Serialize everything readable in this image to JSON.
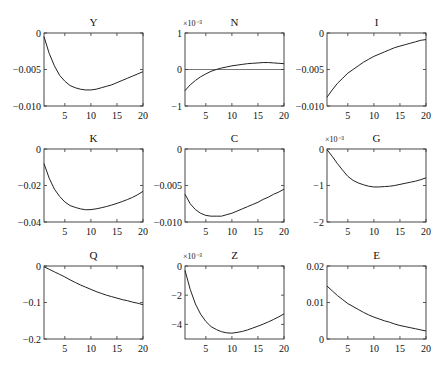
{
  "figure": {
    "layout": {
      "rows": 3,
      "cols": 3
    },
    "colors": {
      "line": "#222222",
      "axes": "#333333",
      "zero_line": "#555555"
    }
  },
  "chart_data": [
    {
      "type": "line",
      "title": "Y",
      "multiplier": "",
      "x": [
        1,
        2,
        3,
        4,
        5,
        6,
        7,
        8,
        9,
        10,
        11,
        12,
        13,
        14,
        15,
        16,
        17,
        18,
        19,
        20
      ],
      "values": [
        -0.0005,
        -0.0028,
        -0.0045,
        -0.0058,
        -0.0066,
        -0.0072,
        -0.0075,
        -0.0077,
        -0.0078,
        -0.0078,
        -0.0077,
        -0.0075,
        -0.0073,
        -0.0071,
        -0.0068,
        -0.0065,
        -0.0062,
        -0.0059,
        -0.0056,
        -0.0053
      ],
      "ylim": [
        -0.01,
        0
      ],
      "yticks": [
        0,
        -0.005,
        -0.01
      ],
      "ytick_labels": [
        "0",
        "-0.005",
        "-0.010"
      ],
      "xticks": [
        5,
        10,
        15,
        20
      ],
      "xlim": [
        1,
        20
      ],
      "zero_line": false
    },
    {
      "type": "line",
      "title": "N",
      "multiplier": "×10⁻³",
      "x": [
        1,
        2,
        3,
        4,
        5,
        6,
        7,
        8,
        9,
        10,
        11,
        12,
        13,
        14,
        15,
        16,
        17,
        18,
        19,
        20
      ],
      "values": [
        -0.58,
        -0.42,
        -0.3,
        -0.2,
        -0.12,
        -0.05,
        0.0,
        0.04,
        0.07,
        0.1,
        0.12,
        0.14,
        0.16,
        0.17,
        0.18,
        0.19,
        0.19,
        0.18,
        0.17,
        0.16
      ],
      "ylim": [
        -1,
        1
      ],
      "yticks": [
        1,
        0,
        -1
      ],
      "ytick_labels": [
        "1",
        "0",
        "-1"
      ],
      "xticks": [
        5,
        10,
        15,
        20
      ],
      "xlim": [
        1,
        20
      ],
      "zero_line": true
    },
    {
      "type": "line",
      "title": "I",
      "multiplier": "",
      "x": [
        1,
        2,
        3,
        4,
        5,
        6,
        7,
        8,
        9,
        10,
        11,
        12,
        13,
        14,
        15,
        16,
        17,
        18,
        19,
        20
      ],
      "values": [
        -0.0088,
        -0.0078,
        -0.0069,
        -0.0062,
        -0.0055,
        -0.005,
        -0.0045,
        -0.004,
        -0.0036,
        -0.0032,
        -0.0029,
        -0.0026,
        -0.0023,
        -0.002,
        -0.0018,
        -0.0016,
        -0.0014,
        -0.0012,
        -0.001,
        -0.0009
      ],
      "ylim": [
        -0.01,
        0
      ],
      "yticks": [
        0,
        -0.005,
        -0.01
      ],
      "ytick_labels": [
        "0",
        "-0.005",
        "-0.010"
      ],
      "xticks": [
        5,
        10,
        15,
        20
      ],
      "xlim": [
        1,
        20
      ],
      "zero_line": false
    },
    {
      "type": "line",
      "title": "K",
      "multiplier": "",
      "x": [
        1,
        2,
        3,
        4,
        5,
        6,
        7,
        8,
        9,
        10,
        11,
        12,
        13,
        14,
        15,
        16,
        17,
        18,
        19,
        20
      ],
      "values": [
        -0.008,
        -0.016,
        -0.022,
        -0.026,
        -0.029,
        -0.031,
        -0.032,
        -0.0328,
        -0.0333,
        -0.0332,
        -0.0328,
        -0.0322,
        -0.0315,
        -0.0307,
        -0.0298,
        -0.0288,
        -0.0277,
        -0.0265,
        -0.025,
        -0.0232
      ],
      "ylim": [
        -0.04,
        0
      ],
      "yticks": [
        0,
        -0.02,
        -0.04
      ],
      "ytick_labels": [
        "0",
        "-0.02",
        "-0.04"
      ],
      "xticks": [
        5,
        10,
        15,
        20
      ],
      "xlim": [
        1,
        20
      ],
      "zero_line": false
    },
    {
      "type": "line",
      "title": "C",
      "multiplier": "",
      "x": [
        1,
        2,
        3,
        4,
        5,
        6,
        7,
        8,
        9,
        10,
        11,
        12,
        13,
        14,
        15,
        16,
        17,
        18,
        19,
        20
      ],
      "values": [
        -0.0062,
        -0.0075,
        -0.0083,
        -0.0088,
        -0.0091,
        -0.0092,
        -0.0092,
        -0.0092,
        -0.009,
        -0.0088,
        -0.0085,
        -0.0082,
        -0.0079,
        -0.0076,
        -0.0073,
        -0.0069,
        -0.0066,
        -0.0062,
        -0.0059,
        -0.0055
      ],
      "ylim": [
        -0.01,
        0
      ],
      "yticks": [
        0,
        -0.005,
        -0.01
      ],
      "ytick_labels": [
        "0",
        "-0.005",
        "-0.010"
      ],
      "xticks": [
        5,
        10,
        15,
        20
      ],
      "xlim": [
        1,
        20
      ],
      "zero_line": false
    },
    {
      "type": "line",
      "title": "G",
      "multiplier": "×10⁻³",
      "x": [
        1,
        2,
        3,
        4,
        5,
        6,
        7,
        8,
        9,
        10,
        11,
        12,
        13,
        14,
        15,
        16,
        17,
        18,
        19,
        20
      ],
      "values": [
        -0.02,
        -0.2,
        -0.4,
        -0.58,
        -0.75,
        -0.86,
        -0.93,
        -0.98,
        -1.02,
        -1.04,
        -1.04,
        -1.03,
        -1.02,
        -1.0,
        -0.97,
        -0.94,
        -0.91,
        -0.88,
        -0.84,
        -0.79
      ],
      "ylim": [
        -2,
        0
      ],
      "yticks": [
        0,
        -1,
        -2
      ],
      "ytick_labels": [
        "0",
        "-1",
        "-2"
      ],
      "xticks": [
        5,
        10,
        15,
        20
      ],
      "xlim": [
        1,
        20
      ],
      "zero_line": false
    },
    {
      "type": "line",
      "title": "Q",
      "multiplier": "",
      "x": [
        1,
        2,
        3,
        4,
        5,
        6,
        7,
        8,
        9,
        10,
        11,
        12,
        13,
        14,
        15,
        16,
        17,
        18,
        19,
        20
      ],
      "values": [
        -0.002,
        -0.009,
        -0.016,
        -0.023,
        -0.03,
        -0.038,
        -0.045,
        -0.052,
        -0.058,
        -0.064,
        -0.07,
        -0.075,
        -0.08,
        -0.084,
        -0.088,
        -0.092,
        -0.095,
        -0.099,
        -0.102,
        -0.106
      ],
      "ylim": [
        -0.2,
        0
      ],
      "yticks": [
        0,
        -0.1,
        -0.2
      ],
      "ytick_labels": [
        "0",
        "-0.1",
        "-0.2"
      ],
      "xticks": [
        5,
        10,
        15,
        20
      ],
      "xlim": [
        1,
        20
      ],
      "zero_line": false
    },
    {
      "type": "line",
      "title": "Z",
      "multiplier": "×10⁻³",
      "x": [
        1,
        2,
        3,
        4,
        5,
        6,
        7,
        8,
        9,
        10,
        11,
        12,
        13,
        14,
        15,
        16,
        17,
        18,
        19,
        20
      ],
      "values": [
        -0.3,
        -1.6,
        -2.6,
        -3.3,
        -3.8,
        -4.15,
        -4.35,
        -4.5,
        -4.58,
        -4.6,
        -4.55,
        -4.48,
        -4.38,
        -4.25,
        -4.12,
        -3.98,
        -3.83,
        -3.66,
        -3.48,
        -3.28
      ],
      "ylim": [
        -5,
        0
      ],
      "yticks": [
        0,
        -2,
        -4
      ],
      "ytick_labels": [
        "0",
        "-2",
        "-4"
      ],
      "xticks": [
        5,
        10,
        15,
        20
      ],
      "xlim": [
        1,
        20
      ],
      "zero_line": false
    },
    {
      "type": "line",
      "title": "E",
      "multiplier": "",
      "x": [
        1,
        2,
        3,
        4,
        5,
        6,
        7,
        8,
        9,
        10,
        11,
        12,
        13,
        14,
        15,
        16,
        17,
        18,
        19,
        20
      ],
      "values": [
        0.0145,
        0.0132,
        0.0119,
        0.0108,
        0.0097,
        0.0089,
        0.0081,
        0.0073,
        0.0066,
        0.006,
        0.0055,
        0.005,
        0.0046,
        0.0041,
        0.0037,
        0.0034,
        0.0031,
        0.0028,
        0.0025,
        0.0022
      ],
      "ylim": [
        0,
        0.02
      ],
      "yticks": [
        0.02,
        0.01,
        0
      ],
      "ytick_labels": [
        "0.02",
        "0.01",
        "0"
      ],
      "xticks": [
        5,
        10,
        15,
        20
      ],
      "xlim": [
        1,
        20
      ],
      "zero_line": false
    }
  ]
}
